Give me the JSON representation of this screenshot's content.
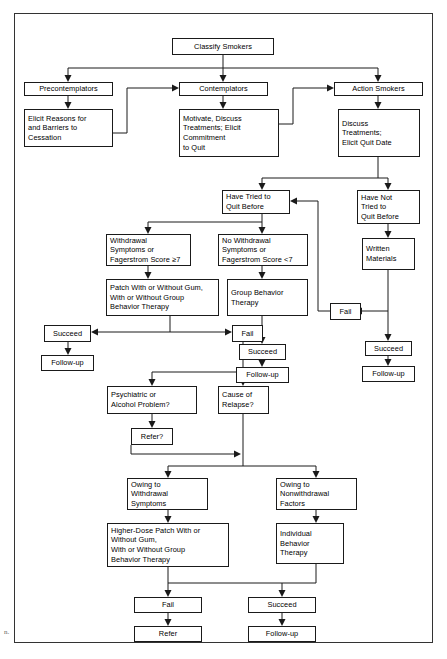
{
  "figure": {
    "type": "flowchart",
    "artifact_mark": "n."
  },
  "nodes": {
    "classify_smokers": "Classify Smokers",
    "precontemplators": "Precontemplators",
    "contemplators": "Contemplators",
    "action_smokers": "Action Smokers",
    "elicit_reasons": "Elicit Reasons for\nand Barriers to\nCessation",
    "motivate_discuss": "Motivate, Discuss\nTreatments; Elicit\nCommitment\n to Quit",
    "discuss_treatments": "Discuss\nTreatments;\nElicit Quit Date",
    "have_tried": "Have Tried to\nQuit Before",
    "have_not_tried": "Have Not\nTried to\nQuit Before",
    "withdrawal_symptoms": "Withdrawal\nSymptoms or\nFagerstrom Score ≥7",
    "no_withdrawal_symptoms": "No Withdrawal\nSymptoms or\nFagerstrom Score <7",
    "written_materials": "Written\nMaterials",
    "patch_therapy": "Patch With or Without Gum,\nWith or Without Group\nBehavior Therapy",
    "group_behavior_therapy": "Group Behavior\nTherapy",
    "succeed_left": "Succeed",
    "fail_center": "Fail",
    "fail_right": "Fail",
    "succeed_right": "Succeed",
    "followup_left": "Follow-up",
    "followup_right": "Follow-up",
    "succeed_mid": "Succeed",
    "followup_mid": "Follow-up",
    "psychiatric_problem": "Psychiatric or\nAlcohol Problem?",
    "cause_of_relapse": "Cause of\nRelapse?",
    "refer_q": "Refer?",
    "owing_withdrawal": "Owing to\nWithdrawal\nSymptoms",
    "owing_nonwithdrawal": "Owing to\nNonwithdrawal\nFactors",
    "higher_dose_patch": "Higher-Dose Patch With or\nWithout Gum,\nWith or Without Group\nBehavior Therapy",
    "individual_behavior_therapy": "Individual\nBehavior\nTherapy",
    "fail_bottom": "Fail",
    "succeed_bottom": "Succeed",
    "refer_bottom": "Refer",
    "followup_bottom": "Follow-up"
  },
  "colors": {
    "border": "#1a1a1a",
    "background": "#ffffff",
    "text": "#000000"
  }
}
